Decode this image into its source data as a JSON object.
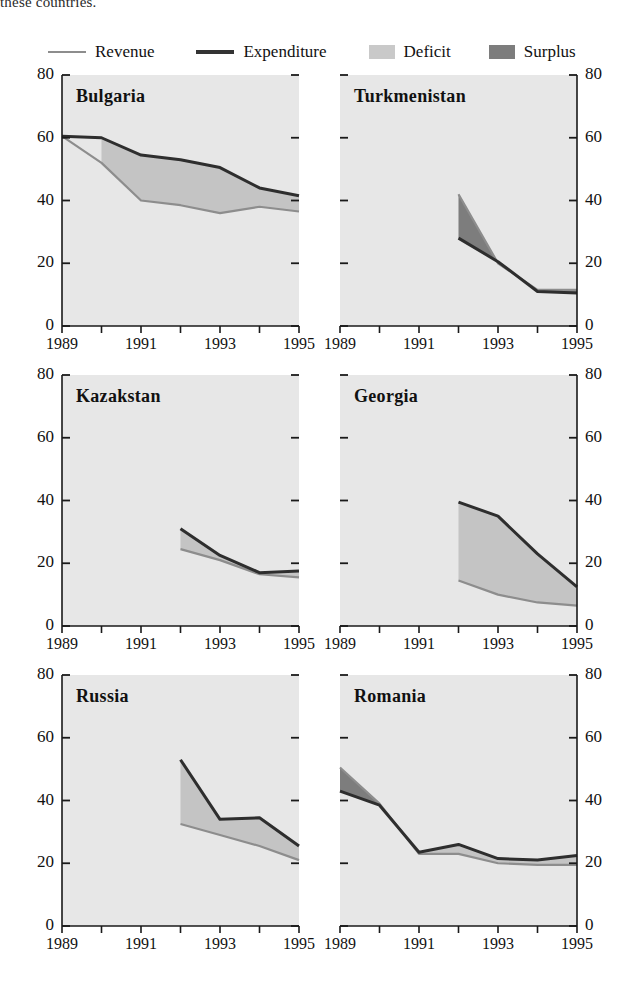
{
  "caption": "these countries.",
  "legend": {
    "position": "top",
    "items": [
      {
        "key": "revenue",
        "label": "Revenue",
        "marker": "line-light",
        "color": "#8d8d8d"
      },
      {
        "key": "expenditure",
        "label": "Expenditure",
        "marker": "line-dark",
        "color": "#333333"
      },
      {
        "key": "deficit",
        "label": "Deficit",
        "marker": "swatch-light",
        "color": "#c9c9c9"
      },
      {
        "key": "surplus",
        "label": "Surplus",
        "marker": "swatch-dark",
        "color": "#7d7d7d"
      }
    ]
  },
  "axes": {
    "ylim": [
      0,
      80
    ],
    "yticks": [
      0,
      20,
      40,
      60,
      80
    ],
    "ytick_labels": [
      "0",
      "20",
      "40",
      "60",
      "80"
    ],
    "xlim": [
      1989,
      1995
    ],
    "xticks": [
      1989,
      1990,
      1991,
      1992,
      1993,
      1994,
      1995
    ],
    "xtick_labels_shown": [
      "1989",
      "1991",
      "1993",
      "1995"
    ],
    "grid": false,
    "plot_background": "#e7e7e7"
  },
  "chart_data": {
    "type": "area",
    "title": "",
    "subtitle": "",
    "xlabel": "",
    "ylabel": "",
    "ylim": [
      0,
      80
    ],
    "xlim": [
      1989,
      1995
    ],
    "grid": false,
    "legend_position": "top",
    "series_names": [
      "Revenue",
      "Expenditure"
    ],
    "fill_rules": {
      "deficit": "expenditure > revenue (light gray fill)",
      "surplus": "revenue > expenditure (dark gray fill)"
    },
    "panels": [
      {
        "name": "Bulgaria",
        "x": [
          1989,
          1990,
          1991,
          1992,
          1993,
          1994,
          1995
        ],
        "series": [
          {
            "name": "Revenue",
            "values": [
              60.5,
              52.0,
              40.0,
              38.5,
              36.0,
              38.0,
              36.5
            ]
          },
          {
            "name": "Expenditure",
            "values": [
              60.5,
              60.0,
              54.5,
              53.0,
              50.5,
              44.0,
              41.5
            ]
          }
        ]
      },
      {
        "name": "Turkmenistan",
        "x": [
          1992,
          1993,
          1994,
          1995
        ],
        "series": [
          {
            "name": "Revenue",
            "values": [
              42.0,
              20.0,
              11.5,
              11.5
            ]
          },
          {
            "name": "Expenditure",
            "values": [
              28.0,
              20.5,
              11.0,
              10.5
            ]
          }
        ]
      },
      {
        "name": "Kazakstan",
        "x": [
          1992,
          1993,
          1994,
          1995
        ],
        "series": [
          {
            "name": "Revenue",
            "values": [
              24.5,
              21.0,
              16.5,
              15.5
            ]
          },
          {
            "name": "Expenditure",
            "values": [
              31.0,
              22.5,
              17.0,
              17.5
            ]
          }
        ]
      },
      {
        "name": "Georgia",
        "x": [
          1992,
          1993,
          1994,
          1995
        ],
        "series": [
          {
            "name": "Revenue",
            "values": [
              14.5,
              10.0,
              7.5,
              6.5
            ]
          },
          {
            "name": "Expenditure",
            "values": [
              39.5,
              35.0,
              23.0,
              12.5
            ]
          }
        ]
      },
      {
        "name": "Russia",
        "x": [
          1992,
          1993,
          1994,
          1995
        ],
        "series": [
          {
            "name": "Revenue",
            "values": [
              32.5,
              29.0,
              25.5,
              21.0
            ]
          },
          {
            "name": "Expenditure",
            "values": [
              53.0,
              34.0,
              34.5,
              25.5
            ]
          }
        ]
      },
      {
        "name": "Romania",
        "x": [
          1989,
          1990,
          1991,
          1992,
          1993,
          1994,
          1995
        ],
        "series": [
          {
            "name": "Revenue",
            "values": [
              50.5,
              39.0,
              23.0,
              23.0,
              20.0,
              19.5,
              19.5
            ]
          },
          {
            "name": "Expenditure",
            "values": [
              43.0,
              38.5,
              23.5,
              26.0,
              21.5,
              21.0,
              22.5
            ]
          }
        ]
      }
    ]
  }
}
